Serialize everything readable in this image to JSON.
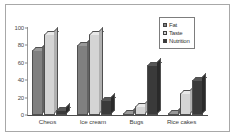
{
  "chart_data": {
    "type": "bar",
    "title": "",
    "subtitle": "",
    "xlabel": "",
    "ylabel": "",
    "grid": false,
    "legend_position": "top-right",
    "categories": [
      "Cheos",
      "Ice cream",
      "Bugs",
      "Rice cakes"
    ],
    "ylim": [
      0,
      100
    ],
    "yticks": [
      0,
      20,
      40,
      60,
      80,
      100
    ],
    "ytick_labels": [
      "0",
      "20",
      "40",
      "60",
      "80",
      "100"
    ],
    "series": [
      {
        "name": "Fat",
        "color": "#808080",
        "top_color": "#999999",
        "side_color": "#636363",
        "values": [
          75,
          80,
          2,
          2
        ]
      },
      {
        "name": "Taste",
        "color": "#d4d4d4",
        "top_color": "#e8e8e8",
        "side_color": "#b0b0b0",
        "values": [
          93,
          93,
          10,
          25
        ]
      },
      {
        "name": "Nutrition",
        "color": "#3a3a3a",
        "top_color": "#565656",
        "side_color": "#2a2a2a",
        "values": [
          6,
          17,
          58,
          40
        ]
      }
    ]
  },
  "legend": {
    "entries": [
      {
        "label": "Fat",
        "color": "#808080"
      },
      {
        "label": "Taste",
        "color": "#d4d4d4"
      },
      {
        "label": "Nutrition",
        "color": "#3a3a3a"
      }
    ]
  },
  "frame": {
    "border_color": "#a8a8a8",
    "background": "#ffffff"
  }
}
